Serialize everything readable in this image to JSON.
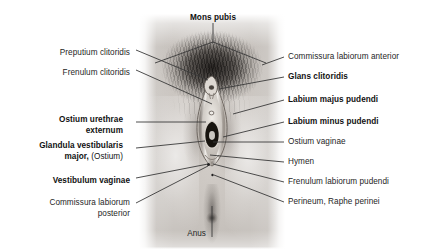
{
  "figure": {
    "background_color": "#ffffff",
    "text_color": "#262626",
    "leader_line_color": "#3a3a3a",
    "width": 421,
    "height": 249
  },
  "labels": {
    "top": [
      {
        "id": "mons-pubis",
        "text": "Mons pubis",
        "bold": true,
        "x": 213,
        "y": 19,
        "align": "center"
      }
    ],
    "left": [
      {
        "id": "preputium-clitoridis",
        "text": "Preputium clitoridis",
        "bold": false,
        "x": 130,
        "y": 50
      },
      {
        "id": "frenulum-clitoridis",
        "text": "Frenulum clitoridis",
        "bold": false,
        "x": 130,
        "y": 70
      },
      {
        "id": "ostium-urethrae-externum",
        "text": "Ostium urethrae",
        "text2": "externum",
        "bold": true,
        "x": 123,
        "y": 116
      },
      {
        "id": "glandula-vestibularis-major",
        "text": "Glandula vestibularis",
        "text2": "major,",
        "text2_suffix": " (Ostium)",
        "bold": true,
        "x": 123,
        "y": 142
      },
      {
        "id": "vestibulum-vaginae",
        "text": "Vestibulum vaginae",
        "bold": true,
        "x": 130,
        "y": 177
      },
      {
        "id": "commissura-labiorum-posterior",
        "text": "Commissura labiorum",
        "text2": "posterior",
        "bold": false,
        "x": 130,
        "y": 199
      }
    ],
    "right": [
      {
        "id": "commissura-labiorum-anterior",
        "text": "Commissura labiorum anterior",
        "bold": false,
        "x": 288,
        "y": 57
      },
      {
        "id": "glans-clitoridis",
        "text": "Glans clitoridis",
        "bold": true,
        "x": 288,
        "y": 77
      },
      {
        "id": "labium-majus-pudendi",
        "text": "Labium majus pudendi",
        "bold": true,
        "x": 288,
        "y": 100
      },
      {
        "id": "labium-minus-pudendi",
        "text": "Labium minus pudendi",
        "bold": true,
        "x": 288,
        "y": 121
      },
      {
        "id": "ostium-vaginae",
        "text": "Ostium vaginae",
        "bold": false,
        "x": 288,
        "y": 141
      },
      {
        "id": "hymen",
        "text": "Hymen",
        "bold": false,
        "x": 288,
        "y": 161
      },
      {
        "id": "frenulum-labiorum-pudendi",
        "text": "Frenulum labiorum pudendi",
        "bold": false,
        "x": 288,
        "y": 181
      },
      {
        "id": "perineum-raphe-perinei",
        "text": "Perineum, Raphe perinei",
        "bold": false,
        "x": 288,
        "y": 201
      }
    ],
    "bottom": [
      {
        "id": "anus",
        "text": "Anus",
        "bold": false,
        "x": 200,
        "y": 231,
        "align": "right"
      }
    ]
  }
}
